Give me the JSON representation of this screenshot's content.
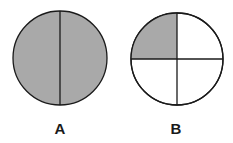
{
  "colors": {
    "shaded": "#a9a9a9",
    "unshaded": "#ffffff",
    "stroke": "#1a1a1a"
  },
  "figures": [
    {
      "label": "A",
      "divisions": 2,
      "shaded_parts": 1,
      "shaded_fraction": "1/2",
      "cx": 60,
      "cy": 58,
      "r": 47
    },
    {
      "label": "B",
      "divisions": 4,
      "shaded_parts": 1,
      "shaded_fraction": "1/4",
      "cx": 177,
      "cy": 59,
      "r": 46
    }
  ]
}
